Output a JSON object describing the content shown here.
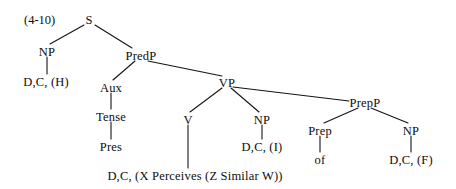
{
  "figure": {
    "example_number": "(4-10)",
    "type": "syntax-tree",
    "root_label": "S"
  },
  "nodes": {
    "s": {
      "label": "S",
      "x": 89,
      "y": 20
    },
    "np_subject": {
      "label": "NP",
      "x": 47,
      "y": 52
    },
    "np_subject_leaf": {
      "label": "D,C, (H)",
      "x": 46,
      "y": 82
    },
    "predp": {
      "label": "PredP",
      "x": 141,
      "y": 56
    },
    "aux": {
      "label": "Aux",
      "x": 111,
      "y": 88
    },
    "tense": {
      "label": "Tense",
      "x": 111,
      "y": 117
    },
    "pres": {
      "label": "Pres",
      "x": 111,
      "y": 147
    },
    "vp": {
      "label": "VP",
      "x": 227,
      "y": 83
    },
    "v": {
      "label": "V",
      "x": 188,
      "y": 120
    },
    "v_leaf": {
      "label": "D,C, (X Perceives (Z Similar W))",
      "x": 195,
      "y": 176
    },
    "np_object": {
      "label": "NP",
      "x": 262,
      "y": 120
    },
    "np_object_leaf": {
      "label": "D,C, (I)",
      "x": 262,
      "y": 147
    },
    "prepp": {
      "label": "PrepP",
      "x": 365,
      "y": 103
    },
    "prep": {
      "label": "Prep",
      "x": 320,
      "y": 131
    },
    "prep_leaf": {
      "label": "of",
      "x": 320,
      "y": 160
    },
    "np_prep": {
      "label": "NP",
      "x": 411,
      "y": 131
    },
    "np_prep_leaf": {
      "label": "D,C, (F)",
      "x": 411,
      "y": 160
    }
  },
  "style": {
    "ink_color": "#141414",
    "background_color": "#ffffff",
    "stroke_width": 1.1
  }
}
